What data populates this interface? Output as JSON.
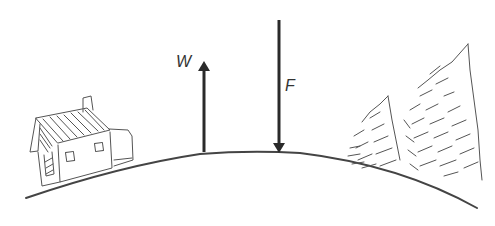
{
  "diagram": {
    "type": "physics-force-diagram",
    "colors": {
      "background": "#ffffff",
      "ink": "#2a2a2a",
      "sketch": "#555555"
    },
    "ground_curve": {
      "start": [
        26,
        198
      ],
      "control": [
        250,
        120
      ],
      "end": [
        477,
        208
      ]
    },
    "arrows": [
      {
        "id": "W",
        "label": "W",
        "direction": "up",
        "x": 204,
        "y_tail": 152,
        "y_tip": 61
      },
      {
        "id": "F",
        "label": "F",
        "direction": "down",
        "x": 279,
        "y_tail": 20,
        "y_tip": 153
      }
    ],
    "illustrations": [
      {
        "id": "house",
        "name": "house-sketch",
        "position": "left-slope"
      },
      {
        "id": "trees",
        "name": "pine-trees-sketch",
        "position": "right-slope"
      }
    ]
  }
}
